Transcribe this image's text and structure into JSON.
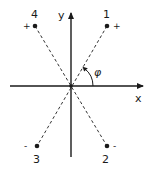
{
  "diagram": {
    "axes": {
      "x_label": "x",
      "y_label": "y"
    },
    "angle_label": "φ",
    "points": [
      {
        "id": "1",
        "label": "1",
        "sign": "+",
        "quadrant": "upper-right"
      },
      {
        "id": "2",
        "label": "2",
        "sign": "-",
        "quadrant": "lower-right"
      },
      {
        "id": "3",
        "label": "3",
        "sign": "-",
        "quadrant": "lower-left"
      },
      {
        "id": "4",
        "label": "4",
        "sign": "+",
        "quadrant": "upper-left"
      }
    ],
    "colors": {
      "ink": "#1a1a1a",
      "background": "#ffffff"
    }
  }
}
